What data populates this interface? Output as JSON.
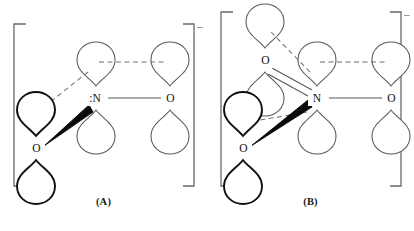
{
  "figure": {
    "type": "orbital-resonance-diagram",
    "panels": [
      {
        "id": "A",
        "caption": "(A)",
        "charge": "–",
        "bracket": "square",
        "atoms": [
          {
            "label": ":N",
            "role": "center-nitrogen",
            "lone_pair": true,
            "x": 96,
            "y": 98
          },
          {
            "label": "O",
            "role": "right-oxygen",
            "lone_pair": false,
            "x": 170,
            "y": 98
          },
          {
            "label": "O",
            "role": "front-left-oxygen",
            "lone_pair": false,
            "x": 36,
            "y": 148
          }
        ],
        "bonds": [
          {
            "from": ":N",
            "to": "O-right",
            "style": "single"
          },
          {
            "from": ":N",
            "to": "O-front-left",
            "style": "bold-wedge"
          }
        ],
        "pi_overlaps": [
          {
            "style": "dashed",
            "from": "N-upper-lobe",
            "to": "O-right-upper-lobe"
          },
          {
            "style": "dashed",
            "from": "N-upper-lobe",
            "to": "O-front-left-upper-lobe"
          }
        ]
      },
      {
        "id": "B",
        "caption": "(B)",
        "charge": "–",
        "bracket": "square",
        "atoms": [
          {
            "label": "N",
            "role": "center-nitrogen",
            "lone_pair": false,
            "x": 110,
            "y": 98
          },
          {
            "label": "O",
            "role": "right-oxygen",
            "lone_pair": false,
            "x": 184,
            "y": 98
          },
          {
            "label": "O",
            "role": "upper-left-oxygen",
            "lone_pair": false,
            "x": 58,
            "y": 60
          },
          {
            "label": "O",
            "role": "front-left-oxygen",
            "lone_pair": false,
            "x": 36,
            "y": 148
          }
        ],
        "bonds": [
          {
            "from": "N",
            "to": "O-right",
            "style": "single"
          },
          {
            "from": "N",
            "to": "O-upper-left",
            "style": "double"
          },
          {
            "from": "N",
            "to": "O-front-left",
            "style": "bold-wedge"
          }
        ],
        "pi_overlaps": [
          {
            "style": "dashed",
            "from": "N-upper-lobe",
            "to": "O-right-upper-lobe"
          },
          {
            "style": "dashed",
            "from": "N-upper-lobe",
            "to": "O-upper-left-upper-lobe"
          },
          {
            "style": "dashed",
            "from": "N-lower-lobe",
            "to": "O-front-left-upper-lobe"
          }
        ]
      }
    ],
    "colors": {
      "stroke_light": "#555555",
      "stroke_dark": "#101010",
      "bracket": "#6a6a6a",
      "text": "#1a1a1a",
      "background": "#ffffff"
    }
  }
}
